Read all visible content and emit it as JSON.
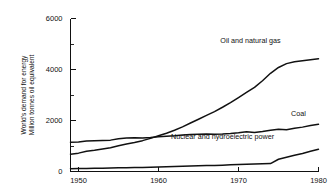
{
  "chart_data": {
    "type": "line",
    "title": "",
    "xlabel": "",
    "ylabel": "World's demand for energy\nMillion tonnes oil equivalent",
    "ylabel_line1": "World's demand for energy",
    "ylabel_line2": "Million tonnes oil equivalent",
    "xlim": [
      1949,
      1980
    ],
    "ylim": [
      0,
      6000
    ],
    "grid": false,
    "legend_position": "inline-annotations",
    "y_ticks_major": [
      0,
      2000,
      4000,
      6000
    ],
    "y_ticks_major_labels": [
      "0",
      "2000",
      "4000",
      "6000"
    ],
    "y_ticks_minor": [
      1000,
      3000,
      5000
    ],
    "x_ticks": [
      1950,
      1960,
      1970,
      1980
    ],
    "x_tick_labels": [
      "1950",
      "1960",
      "1970",
      "1980"
    ],
    "x": [
      1949,
      1950,
      1951,
      1952,
      1953,
      1954,
      1955,
      1956,
      1957,
      1958,
      1959,
      1960,
      1961,
      1962,
      1963,
      1964,
      1965,
      1966,
      1967,
      1968,
      1969,
      1970,
      1971,
      1972,
      1973,
      1974,
      1975,
      1976,
      1977,
      1978,
      1979,
      1980
    ],
    "series": [
      {
        "name": "Oil and natural gas",
        "label": "Oil and natural gas",
        "label_x": 1971.5,
        "label_y": 5020,
        "values": [
          680,
          720,
          790,
          830,
          880,
          930,
          1010,
          1080,
          1140,
          1210,
          1300,
          1400,
          1500,
          1620,
          1750,
          1900,
          2050,
          2200,
          2350,
          2520,
          2700,
          2900,
          3100,
          3300,
          3560,
          3850,
          4080,
          4230,
          4300,
          4340,
          4380,
          4420
        ]
      },
      {
        "name": "Coal",
        "label": "Coal",
        "label_x": 1977.5,
        "label_y": 2180,
        "values": [
          1150,
          1160,
          1200,
          1210,
          1220,
          1230,
          1280,
          1310,
          1320,
          1310,
          1330,
          1360,
          1380,
          1400,
          1430,
          1450,
          1460,
          1470,
          1460,
          1470,
          1490,
          1520,
          1560,
          1530,
          1570,
          1620,
          1660,
          1640,
          1700,
          1740,
          1800,
          1850
        ]
      },
      {
        "name": "Nuclear and hydroelectric power",
        "label": "Nuclear and hydroelectric power",
        "label_x": 1968.0,
        "label_y": 1290,
        "values": [
          110,
          115,
          120,
          125,
          130,
          135,
          145,
          150,
          155,
          160,
          170,
          180,
          190,
          200,
          210,
          215,
          225,
          235,
          240,
          250,
          260,
          270,
          280,
          290,
          300,
          310,
          480,
          560,
          640,
          710,
          790,
          870
        ]
      }
    ]
  }
}
